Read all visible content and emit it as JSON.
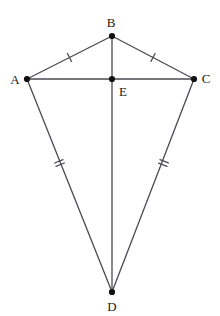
{
  "figure": {
    "background_color": "#ffffff",
    "stroke_color": "#4a4a52",
    "vertex_color": "#111111",
    "label_color": "#1a1a1a",
    "stroke_width": 1.3,
    "vertex_radius": 3.1,
    "width": 220,
    "height": 316
  },
  "points": {
    "A": {
      "label": "A",
      "x": 27,
      "y": 79,
      "label_x": 15,
      "label_y": 79
    },
    "B": {
      "label": "B",
      "x": 112,
      "y": 36,
      "label_x": 111,
      "label_y": 22
    },
    "C": {
      "label": "C",
      "x": 194,
      "y": 79,
      "label_x": 206,
      "label_y": 78
    },
    "D": {
      "label": "D",
      "x": 112,
      "y": 292,
      "label_x": 112,
      "label_y": 306
    },
    "E": {
      "label": "E",
      "x": 112,
      "y": 79,
      "label_x": 123,
      "label_y": 91
    }
  },
  "segments": [
    {
      "name": "AB",
      "from": "A",
      "to": "B",
      "ticks": 1
    },
    {
      "name": "BC",
      "from": "B",
      "to": "C",
      "ticks": 1
    },
    {
      "name": "AD",
      "from": "A",
      "to": "D",
      "ticks": 2
    },
    {
      "name": "CD",
      "from": "C",
      "to": "D",
      "ticks": 2
    },
    {
      "name": "AC",
      "from": "A",
      "to": "C",
      "ticks": 0
    },
    {
      "name": "BD",
      "from": "B",
      "to": "D",
      "ticks": 0
    }
  ],
  "tick_marks": [
    {
      "segment": "AB",
      "count": 1,
      "x": 69.5,
      "y": 57.5,
      "length": 9,
      "spacing": 3.4
    },
    {
      "segment": "BC",
      "count": 1,
      "x": 153.0,
      "y": 57.5,
      "length": 9,
      "spacing": 3.4
    },
    {
      "segment": "AD",
      "count": 2,
      "x": 59.5,
      "y": 163.0,
      "length": 9,
      "spacing": 3.6
    },
    {
      "segment": "CD",
      "count": 2,
      "x": 163.5,
      "y": 163.0,
      "length": 9,
      "spacing": 3.6
    }
  ],
  "vertex_order": [
    "A",
    "B",
    "C",
    "D",
    "E"
  ]
}
